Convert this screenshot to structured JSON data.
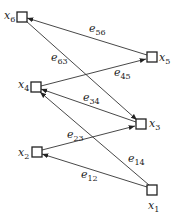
{
  "diagram": {
    "type": "directed-graph",
    "nodes": [
      {
        "id": "x1",
        "label": "x",
        "sub": "1",
        "x": 152,
        "y": 190
      },
      {
        "id": "x2",
        "label": "x",
        "sub": "2",
        "x": 37,
        "y": 152
      },
      {
        "id": "x3",
        "label": "x",
        "sub": "3",
        "x": 141,
        "y": 124
      },
      {
        "id": "x4",
        "label": "x",
        "sub": "4",
        "x": 36,
        "y": 87
      },
      {
        "id": "x5",
        "label": "x",
        "sub": "5",
        "x": 152,
        "y": 57
      },
      {
        "id": "x6",
        "label": "x",
        "sub": "6",
        "x": 22,
        "y": 17
      }
    ],
    "edges": [
      {
        "id": "e12",
        "label": "e",
        "sub": "12",
        "from": "x1",
        "to": "x2"
      },
      {
        "id": "e14",
        "label": "e",
        "sub": "14",
        "from": "x1",
        "to": "x4"
      },
      {
        "id": "e23",
        "label": "e",
        "sub": "23",
        "from": "x2",
        "to": "x3"
      },
      {
        "id": "e34",
        "label": "e",
        "sub": "34",
        "from": "x3",
        "to": "x4"
      },
      {
        "id": "e45",
        "label": "e",
        "sub": "45",
        "from": "x4",
        "to": "x5"
      },
      {
        "id": "e56",
        "label": "e",
        "sub": "56",
        "from": "x5",
        "to": "x6"
      },
      {
        "id": "e63",
        "label": "e",
        "sub": "63",
        "from": "x6",
        "to": "x3"
      }
    ]
  }
}
